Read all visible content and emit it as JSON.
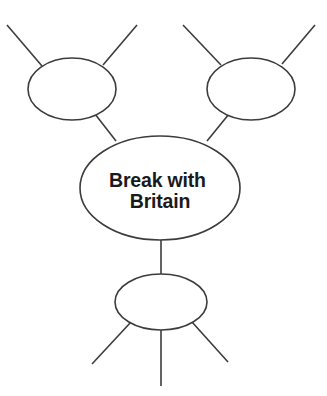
{
  "diagram": {
    "type": "concept-map",
    "title": "",
    "background_color": "#ffffff",
    "stroke_color": "#3c3c3c",
    "text_color": "#1a1a1a",
    "center_node": {
      "id": "center",
      "label_line_1": "Break with",
      "label_line_2": "Britain",
      "label_full": "Break with Britain",
      "cx": 160,
      "cy": 188,
      "rx": 80,
      "ry": 52
    },
    "satellite_nodes": [
      {
        "id": "top-left",
        "label": "",
        "cx": 72,
        "cy": 89,
        "rx": 44,
        "ry": 31
      },
      {
        "id": "top-right",
        "label": "",
        "cx": 251,
        "cy": 89,
        "rx": 44,
        "ry": 31
      },
      {
        "id": "bottom",
        "label": "",
        "cx": 161,
        "cy": 302,
        "rx": 46,
        "ry": 28
      }
    ],
    "connectors": [
      {
        "id": "center-to-top-left",
        "from": "center",
        "to": "top-left"
      },
      {
        "id": "center-to-top-right",
        "from": "center",
        "to": "top-right"
      },
      {
        "id": "center-to-bottom",
        "from": "center",
        "to": "bottom"
      }
    ],
    "branch_lines": [
      {
        "id": "top-left-branch-a",
        "node": "top-left",
        "direction": "up-left"
      },
      {
        "id": "top-left-branch-b",
        "node": "top-left",
        "direction": "up-right"
      },
      {
        "id": "top-right-branch-a",
        "node": "top-right",
        "direction": "up-left"
      },
      {
        "id": "top-right-branch-b",
        "node": "top-right",
        "direction": "up-right"
      },
      {
        "id": "bottom-branch-a",
        "node": "bottom",
        "direction": "down-left"
      },
      {
        "id": "bottom-branch-b",
        "node": "bottom",
        "direction": "down"
      },
      {
        "id": "bottom-branch-c",
        "node": "bottom",
        "direction": "down-right"
      }
    ]
  }
}
